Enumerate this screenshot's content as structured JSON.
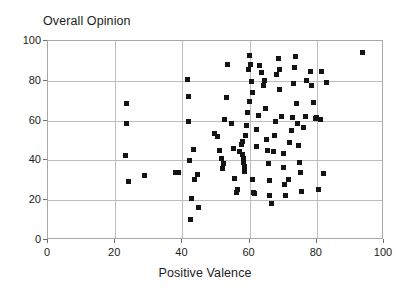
{
  "chart_data": {
    "type": "scatter",
    "title": "Overall Opinion",
    "xlabel": "Positive Valence",
    "ylabel": "",
    "xlim": [
      0,
      100
    ],
    "ylim": [
      0,
      100
    ],
    "xticks": [
      0,
      20,
      40,
      60,
      80,
      100
    ],
    "yticks": [
      0,
      20,
      40,
      60,
      80,
      100
    ],
    "xtick_labels": [
      "0",
      "20",
      "40",
      "60",
      "80",
      "100"
    ],
    "ytick_labels": [
      "0",
      "20",
      "40",
      "60",
      "80",
      "100"
    ],
    "grid": true,
    "legend": null,
    "marker": "square",
    "marker_color": "#141414",
    "marker_size": 5,
    "frame_color": "#a8a8a8",
    "grid_color": "#bdbdbd",
    "n_points": 104,
    "points": [
      [
        23.5,
        68.5
      ],
      [
        23.5,
        58.5
      ],
      [
        23.2,
        42.5
      ],
      [
        24.0,
        29.5
      ],
      [
        28.8,
        32.5
      ],
      [
        37.8,
        33.8
      ],
      [
        38.8,
        33.8
      ],
      [
        41.8,
        72.0
      ],
      [
        41.5,
        80.5
      ],
      [
        41.8,
        59.5
      ],
      [
        42.0,
        40.0
      ],
      [
        43.2,
        45.5
      ],
      [
        43.5,
        30.5
      ],
      [
        44.5,
        33.0
      ],
      [
        42.8,
        21.0
      ],
      [
        42.5,
        10.5
      ],
      [
        44.8,
        16.5
      ],
      [
        49.5,
        53.5
      ],
      [
        50.5,
        52.0
      ],
      [
        51.0,
        45.0
      ],
      [
        51.5,
        41.0
      ],
      [
        51.8,
        36.0
      ],
      [
        52.2,
        38.5
      ],
      [
        52.5,
        60.5
      ],
      [
        53.0,
        71.5
      ],
      [
        53.5,
        88.0
      ],
      [
        54.5,
        58.5
      ],
      [
        55.2,
        46.0
      ],
      [
        55.5,
        31.0
      ],
      [
        56.0,
        24.0
      ],
      [
        56.5,
        25.5
      ],
      [
        57.0,
        44.5
      ],
      [
        57.5,
        48.0
      ],
      [
        57.8,
        49.5
      ],
      [
        58.0,
        43.0
      ],
      [
        58.2,
        41.0
      ],
      [
        58.3,
        39.0
      ],
      [
        58.5,
        37.0
      ],
      [
        58.5,
        34.5
      ],
      [
        58.8,
        52.5
      ],
      [
        59.0,
        57.5
      ],
      [
        59.5,
        64.0
      ],
      [
        59.8,
        85.5
      ],
      [
        60.0,
        92.5
      ],
      [
        60.2,
        88.0
      ],
      [
        60.5,
        79.5
      ],
      [
        60.8,
        74.0
      ],
      [
        60.0,
        69.5
      ],
      [
        61.0,
        30.5
      ],
      [
        61.2,
        24.0
      ],
      [
        61.5,
        23.5
      ],
      [
        62.0,
        47.0
      ],
      [
        62.2,
        55.5
      ],
      [
        62.5,
        62.5
      ],
      [
        63.0,
        87.5
      ],
      [
        63.5,
        84.0
      ],
      [
        64.0,
        77.5
      ],
      [
        64.5,
        80.0
      ],
      [
        64.8,
        66.0
      ],
      [
        65.0,
        50.5
      ],
      [
        65.2,
        45.0
      ],
      [
        65.5,
        38.5
      ],
      [
        65.8,
        30.0
      ],
      [
        66.0,
        22.5
      ],
      [
        66.5,
        18.5
      ],
      [
        67.0,
        44.5
      ],
      [
        67.5,
        52.5
      ],
      [
        67.8,
        59.5
      ],
      [
        68.0,
        83.0
      ],
      [
        68.5,
        91.0
      ],
      [
        68.8,
        85.5
      ],
      [
        69.0,
        75.5
      ],
      [
        69.5,
        62.0
      ],
      [
        70.0,
        43.5
      ],
      [
        70.2,
        36.5
      ],
      [
        70.5,
        28.0
      ],
      [
        70.8,
        22.5
      ],
      [
        71.5,
        30.5
      ],
      [
        72.0,
        49.0
      ],
      [
        72.5,
        55.0
      ],
      [
        72.8,
        61.5
      ],
      [
        73.0,
        78.5
      ],
      [
        73.5,
        86.5
      ],
      [
        73.8,
        92.0
      ],
      [
        74.0,
        68.5
      ],
      [
        74.2,
        58.5
      ],
      [
        74.5,
        47.5
      ],
      [
        74.8,
        39.0
      ],
      [
        75.0,
        34.0
      ],
      [
        75.5,
        24.5
      ],
      [
        76.0,
        56.5
      ],
      [
        76.5,
        62.0
      ],
      [
        77.0,
        80.0
      ],
      [
        78.0,
        84.5
      ],
      [
        78.5,
        77.5
      ],
      [
        79.0,
        69.0
      ],
      [
        79.5,
        61.0
      ],
      [
        80.0,
        61.5
      ],
      [
        81.0,
        60.5
      ],
      [
        81.5,
        84.5
      ],
      [
        82.0,
        33.5
      ],
      [
        80.5,
        25.5
      ],
      [
        83.0,
        79.0
      ],
      [
        93.5,
        94.0
      ]
    ]
  }
}
